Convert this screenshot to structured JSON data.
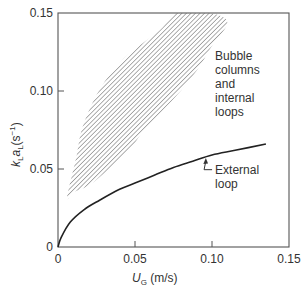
{
  "chart_data": {
    "type": "line",
    "title": "",
    "xlabel": {
      "main": "U",
      "sub": "G",
      "unit": " (m/s)"
    },
    "ylabel": {
      "k": "k",
      "kSub": "L",
      "a": "a",
      "aSub": "L",
      "unit": "(s",
      "sup": "−1",
      "close": ")"
    },
    "xlim": [
      0,
      0.15
    ],
    "ylim": [
      0,
      0.15
    ],
    "grid": false,
    "x_ticks": [
      {
        "value": 0,
        "label": "0"
      },
      {
        "value": 0.05,
        "label": "0.05"
      },
      {
        "value": 0.1,
        "label": "0.10"
      },
      {
        "value": 0.15,
        "label": "0.15"
      }
    ],
    "y_ticks": [
      {
        "value": 0,
        "label": "0"
      },
      {
        "value": 0.05,
        "label": "0.05"
      },
      {
        "value": 0.1,
        "label": "0.10"
      },
      {
        "value": 0.15,
        "label": "0.15"
      }
    ],
    "series": [
      {
        "name": "External loop",
        "kind": "curve",
        "color": "#222222",
        "x": [
          0,
          0.002,
          0.008,
          0.017,
          0.027,
          0.04,
          0.05,
          0.0625,
          0.075,
          0.0875,
          0.1,
          0.115,
          0.135
        ],
        "y": [
          0,
          0.006,
          0.016,
          0.024,
          0.03,
          0.037,
          0.041,
          0.046,
          0.051,
          0.055,
          0.059,
          0.062,
          0.066
        ]
      },
      {
        "name": "Bubble columns and internal loops",
        "kind": "hatched-region",
        "color": "#777777",
        "boundary_x": [
          0.006,
          0.012,
          0.016,
          0.027,
          0.043,
          0.066,
          0.077,
          0.0985,
          0.11,
          0.1,
          0.09,
          0.076,
          0.056,
          0.047,
          0.033,
          0.021,
          0.01,
          0.006
        ],
        "boundary_y": [
          0.032,
          0.058,
          0.077,
          0.101,
          0.121,
          0.139,
          0.15,
          0.15,
          0.144,
          0.129,
          0.113,
          0.096,
          0.075,
          0.063,
          0.05,
          0.04,
          0.035,
          0.032
        ]
      }
    ],
    "annotations": [
      {
        "target": "Bubble columns and internal loops",
        "lines": [
          "Bubble",
          "columns",
          "and",
          "internal",
          "loops"
        ],
        "x": 0.102,
        "y": 0.12
      },
      {
        "target": "External loop",
        "lines": [
          "External",
          "loop"
        ],
        "x": 0.102,
        "y": 0.047,
        "arrow_to": {
          "x": 0.096,
          "y": 0.057
        }
      }
    ]
  }
}
